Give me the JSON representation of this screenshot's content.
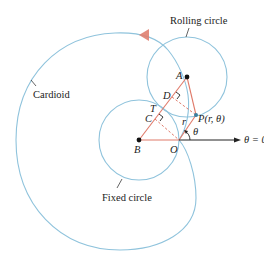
{
  "labels": {
    "rolling_circle": "Rolling circle",
    "cardioid": "Cardioid",
    "fixed_circle": "Fixed circle",
    "point_A": "A",
    "point_B": "B",
    "point_C": "C",
    "point_D": "D",
    "point_T": "T",
    "point_O": "O",
    "point_P": "P(r, θ)",
    "r": "r",
    "theta": "θ",
    "polar_axis": "θ = 0"
  },
  "colors": {
    "curve": "#8fc3dc",
    "segment": "#e07a6a",
    "axis": "#222222",
    "arrow": "#e08070",
    "point": "#111111",
    "point_P": "#3a7fa0"
  }
}
